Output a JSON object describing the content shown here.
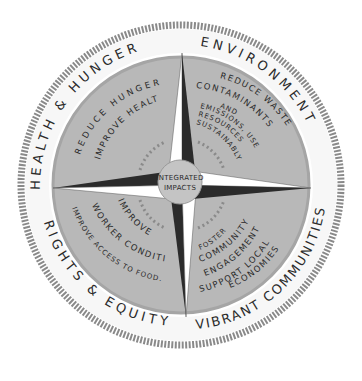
{
  "center": {
    "line1": "INTEGRATED",
    "line2": "IMPACTS"
  },
  "ring_labels": {
    "top_left": "HEALTH & HUNGER",
    "top_right": "ENVIRONMENT",
    "bottom_left": "RIGHTS & EQUITY",
    "bottom_right": "VIBRANT COMMUNITIES"
  },
  "quadrants": {
    "health": {
      "lines": [
        "REDUCE HUNGER",
        "IMPROVE HEALTH"
      ]
    },
    "environment": {
      "lines": [
        "REDUCE WASTE",
        "CONTAMINANTS",
        "AND",
        "EMISSIONS, USE",
        "RESOURCES",
        "SUSTAINABLY"
      ]
    },
    "rights": {
      "lines": [
        "IMPROVE",
        "WORKER CONDITIONS",
        "IMPROVE ACCESS TO FOOD."
      ]
    },
    "communities": {
      "lines": [
        "FOSTER",
        "COMMUNITY",
        "ENGAGEMENT",
        "SUPPORT LOCAL",
        "ECONOMIES"
      ]
    }
  },
  "colors": {
    "ring": "#8a8a8a",
    "disk": "#b8b8b8",
    "star_dark": "#2b2b2b",
    "star_light": "#ffffff",
    "center": "#c4c4c4"
  }
}
